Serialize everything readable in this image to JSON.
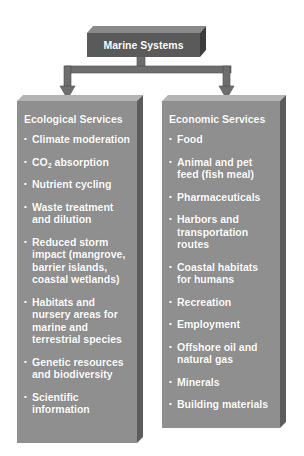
{
  "diagram": {
    "root": {
      "label": "Marine Systems"
    },
    "columns": [
      {
        "heading": "Ecological Services",
        "items": [
          {
            "lines": [
              "Climate moderation"
            ]
          },
          {
            "lines": [
              "CO2 absorption"
            ],
            "rich": "CO<sub>2</sub> absorption"
          },
          {
            "lines": [
              "Nutrient cycling"
            ]
          },
          {
            "lines": [
              "Waste treatment",
              "and dilution"
            ]
          },
          {
            "lines": [
              "Reduced storm",
              "impact (mangrove,",
              "barrier islands,",
              "coastal wetlands)"
            ]
          },
          {
            "lines": [
              "Habitats and",
              "nursery areas for",
              "marine and",
              "terrestrial species"
            ]
          },
          {
            "lines": [
              "Genetic resources",
              "and biodiversity"
            ]
          },
          {
            "lines": [
              "Scientific",
              "information"
            ]
          }
        ]
      },
      {
        "heading": "Economic Services",
        "items": [
          {
            "lines": [
              "Food"
            ]
          },
          {
            "lines": [
              "Animal and pet",
              "feed (fish meal)"
            ]
          },
          {
            "lines": [
              "Pharmaceuticals"
            ]
          },
          {
            "lines": [
              "Harbors and",
              "transportation",
              "routes"
            ]
          },
          {
            "lines": [
              "Coastal habitats",
              "for humans"
            ]
          },
          {
            "lines": [
              "Recreation"
            ]
          },
          {
            "lines": [
              "Employment"
            ]
          },
          {
            "lines": [
              "Offshore oil and",
              "natural gas"
            ]
          },
          {
            "lines": [
              "Minerals"
            ]
          },
          {
            "lines": [
              "Building materials"
            ]
          }
        ]
      }
    ]
  },
  "colors": {
    "root_front": "#5a5a5a",
    "root_top": "#8a8a8a",
    "root_side": "#3c3c3c",
    "column_front": "#8f8f8f",
    "column_top": "#b4b4b4",
    "column_side": "#5c5c5c",
    "connector": "#6e6e6e",
    "text": "#ffffff"
  }
}
